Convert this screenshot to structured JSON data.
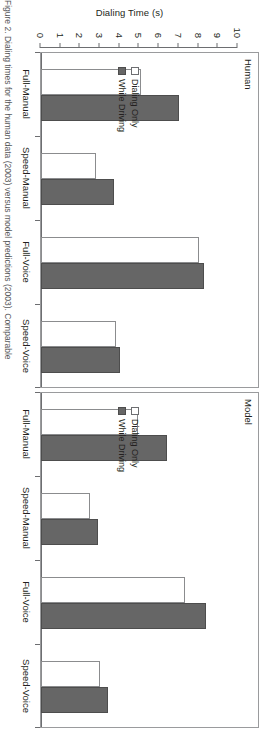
{
  "figure": {
    "y_axis_label": "Dialing Time (s)",
    "caption_partial": "Figure 2. Dialing times for the human data (2003) versus model predictions (2003). Comparable"
  },
  "legend": {
    "position": "inside-panel-left",
    "items": [
      {
        "label": "Dialing Only",
        "color": "#ffffff",
        "style": "outline"
      },
      {
        "label": "While Driving",
        "color": "#666666",
        "style": "filled"
      }
    ]
  },
  "chart_data": {
    "type": "bar",
    "title": "",
    "xlabel": "",
    "ylabel": "Dialing Time (s)",
    "ylim": [
      0,
      10
    ],
    "yticks": [
      0,
      1,
      2,
      3,
      4,
      5,
      6,
      7,
      8,
      9,
      10
    ],
    "grid": false,
    "orientation": "vertical",
    "panels": [
      {
        "name": "Human",
        "categories": [
          "Full-Manual",
          "Speed-Manual",
          "Full-Voice",
          "Speed-Voice"
        ],
        "series": [
          {
            "name": "Dialing Only",
            "values": [
              5.1,
              2.8,
              8.0,
              3.8
            ]
          },
          {
            "name": "While Driving",
            "values": [
              7.0,
              3.7,
              8.3,
              4.0
            ]
          }
        ]
      },
      {
        "name": "Model",
        "categories": [
          "Full-Manual",
          "Speed-Manual",
          "Full-Voice",
          "Speed-Voice"
        ],
        "series": [
          {
            "name": "Dialing Only",
            "values": [
              4.9,
              2.5,
              7.3,
              3.0
            ]
          },
          {
            "name": "While Driving",
            "values": [
              6.4,
              2.9,
              8.4,
              3.4
            ]
          }
        ]
      }
    ]
  }
}
